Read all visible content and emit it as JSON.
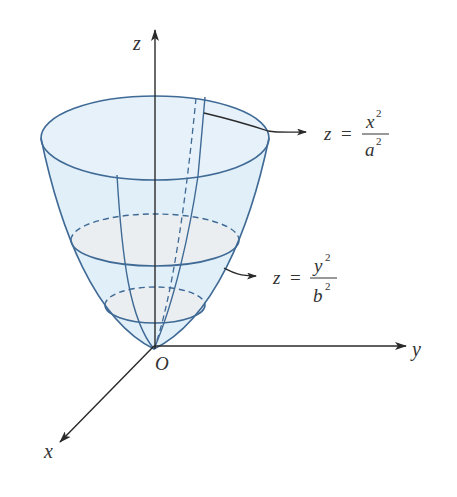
{
  "figure": {
    "type": "elliptic-paraboloid",
    "axes": {
      "x_label": "x",
      "y_label": "y",
      "z_label": "z",
      "origin_label": "O"
    },
    "annotations": [
      {
        "id": "xz-trace",
        "lhs": "z",
        "eq": "=",
        "numerator": "x",
        "numerator_exp": "2",
        "denominator": "a",
        "denominator_exp": "2"
      },
      {
        "id": "yz-trace",
        "lhs": "z",
        "eq": "=",
        "numerator": "y",
        "numerator_exp": "2",
        "denominator": "b",
        "denominator_exp": "2"
      }
    ],
    "colors": {
      "surface_fill": "#dcecf7",
      "surface_stroke": "#3f6a96",
      "axis": "#333333",
      "cross_section_fill": "#ebeef0"
    }
  }
}
